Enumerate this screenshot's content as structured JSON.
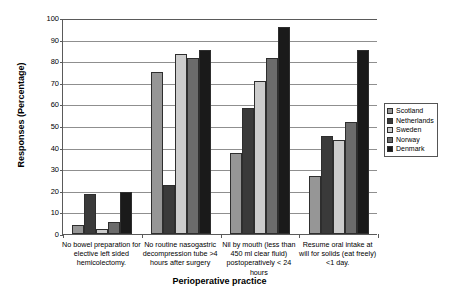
{
  "chart_data": {
    "type": "bar",
    "title": "",
    "xlabel": "Perioperative practice",
    "ylabel": "Responses (Percentage)",
    "ylim": [
      0,
      100
    ],
    "ytick_step": 10,
    "yticks": [
      0,
      10,
      20,
      30,
      40,
      50,
      60,
      70,
      80,
      90,
      100
    ],
    "grid": "horizontal",
    "legend_position": "right",
    "categories": [
      "No bowel preparation for elective left sided hemicolectomy.",
      "No routine nasogastric decompression tube >4 hours after surgery",
      "Nil by mouth (less than 450 ml clear fluid) postoperatively < 24 hours",
      "Resume oral intake at will for solids (eat freely) <1 day."
    ],
    "series": [
      {
        "name": "Scotland",
        "color": "#969696",
        "values": [
          4.0,
          75.0,
          37.5,
          27.0
        ]
      },
      {
        "name": "Netherlands",
        "color": "#3a3a3a",
        "values": [
          18.5,
          22.5,
          58.5,
          45.5
        ]
      },
      {
        "name": "Sweden",
        "color": "#cccccc",
        "values": [
          2.5,
          83.5,
          71.0,
          43.5
        ]
      },
      {
        "name": "Norway",
        "color": "#6b6b6b",
        "values": [
          5.5,
          81.5,
          81.5,
          52.0
        ]
      },
      {
        "name": "Denmark",
        "color": "#1a1a1a",
        "values": [
          19.5,
          85.0,
          96.0,
          85.0
        ]
      }
    ]
  },
  "axis": {
    "y_title": "Responses (Percentage)",
    "x_title": "Perioperative practice",
    "y_tick_labels": [
      "0",
      "10",
      "20",
      "30",
      "40",
      "50",
      "60",
      "70",
      "80",
      "90",
      "100"
    ]
  },
  "legend": {
    "items": [
      {
        "label": "Scotland"
      },
      {
        "label": "Netherlands"
      },
      {
        "label": "Sweden"
      },
      {
        "label": "Norway"
      },
      {
        "label": "Denmark"
      }
    ]
  },
  "x_labels": [
    "No bowel preparation for elective left sided hemicolectomy.",
    "No routine nasogastric decompression tube >4 hours after surgery",
    "Nil by mouth (less than 450 ml clear fluid) postoperatively < 24 hours",
    "Resume oral intake at will for solids (eat freely) <1 day."
  ]
}
